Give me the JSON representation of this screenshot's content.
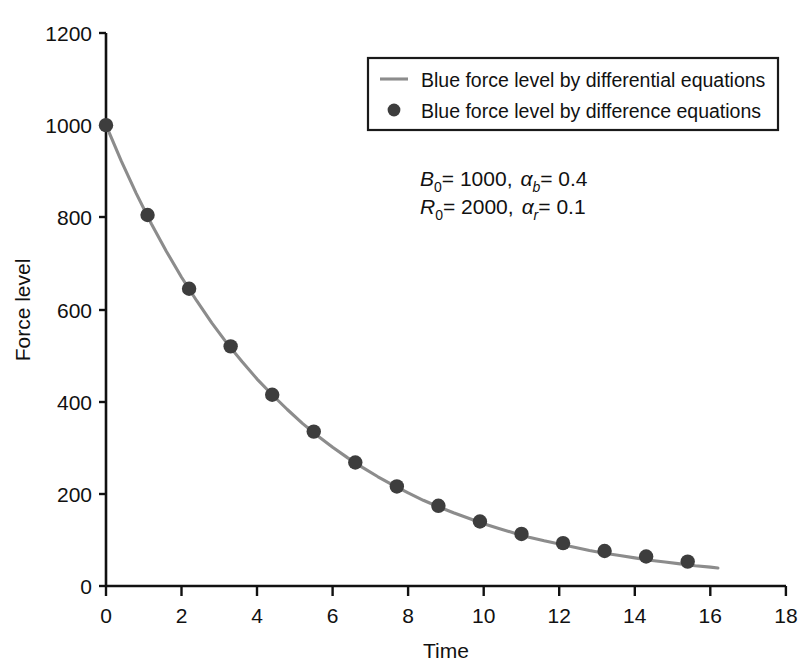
{
  "chart_data": {
    "type": "line",
    "title": "",
    "subtitle": "",
    "xlabel": "Time",
    "ylabel": "Force level",
    "xlim": [
      0,
      18
    ],
    "ylim": [
      0,
      1200
    ],
    "xticks": [
      0,
      2,
      4,
      6,
      8,
      10,
      12,
      14,
      16,
      18
    ],
    "yticks": [
      0,
      200,
      400,
      600,
      800,
      1000,
      1200
    ],
    "xtick_labels": [
      "0",
      "2",
      "4",
      "6",
      "8",
      "10",
      "12",
      "14",
      "16",
      "18"
    ],
    "ytick_labels": [
      "0",
      "200",
      "400",
      "600",
      "800",
      "1000",
      "1200"
    ],
    "grid": false,
    "legend_position": "top-right",
    "series": [
      {
        "name": "Blue force level by differential equations",
        "marker": "line",
        "color": "#8c8c8c",
        "x": [
          0.0,
          0.4,
          0.8,
          1.2,
          1.6,
          2.0,
          2.4,
          2.8,
          3.2,
          3.6,
          4.0,
          4.4,
          4.8,
          5.2,
          5.6,
          6.0,
          6.4,
          6.8,
          7.2,
          7.6,
          8.0,
          8.4,
          8.8,
          9.2,
          9.6,
          10.0,
          10.4,
          10.8,
          11.2,
          11.6,
          12.0,
          12.4,
          12.8,
          13.2,
          13.6,
          14.0,
          14.4,
          14.8,
          15.2,
          15.6,
          16.0,
          16.2
        ],
        "values": [
          1000,
          923,
          852,
          786,
          726,
          670,
          619,
          571,
          527,
          487,
          449,
          415,
          383,
          353,
          326,
          301,
          278,
          257,
          237,
          219,
          202,
          186,
          172,
          159,
          147,
          135,
          125,
          115,
          106,
          98,
          91,
          84,
          77,
          71,
          66,
          61,
          56,
          52,
          48,
          44,
          41,
          39
        ]
      },
      {
        "name": "Blue force level by difference equations",
        "marker": "circle",
        "color": "#3d3d3d",
        "x": [
          0.0,
          1.1,
          2.2,
          3.3,
          4.4,
          5.5,
          6.6,
          7.7,
          8.8,
          9.9,
          11.0,
          12.1,
          13.2,
          14.3,
          15.4
        ],
        "values": [
          1000,
          805,
          645,
          520,
          415,
          335,
          268,
          216,
          174,
          140,
          113,
          93,
          76,
          64,
          53
        ]
      }
    ],
    "annotations": [
      {
        "id": "param-line-1",
        "text": "B0 = 1000, αb = 0.4",
        "parts": [
          {
            "sym": "B",
            "sub": "0",
            "eq": "= 1000,"
          },
          {
            "sym": "α",
            "sub": "b",
            "eq": "= 0.4"
          }
        ]
      },
      {
        "id": "param-line-2",
        "text": "R0 = 2000, αr = 0.1",
        "parts": [
          {
            "sym": "R",
            "sub": "0",
            "eq": "= 2000,"
          },
          {
            "sym": "α",
            "sub": "r",
            "eq": "= 0.1"
          }
        ]
      }
    ]
  },
  "axes": {
    "x_title": "Time",
    "y_title": "Force level",
    "x_ticks": [
      "0",
      "2",
      "4",
      "6",
      "8",
      "10",
      "12",
      "14",
      "16",
      "18"
    ],
    "y_ticks": [
      "1200",
      "1000",
      "800",
      "600",
      "400",
      "200",
      "0"
    ]
  },
  "legend": {
    "entries": [
      {
        "label": "Blue force level by differential equations",
        "marker": "line",
        "color": "#8c8c8c"
      },
      {
        "label": "Blue force level by difference equations",
        "marker": "circle",
        "color": "#3d3d3d"
      }
    ]
  },
  "annotation": {
    "line1": {
      "var": "B",
      "var_sub": "0",
      "var_value": "= 1000,",
      "alpha": "α",
      "alpha_sub": "b",
      "alpha_value": "= 0.4"
    },
    "line2": {
      "var": "R",
      "var_sub": "0",
      "var_value": "= 2000,",
      "alpha": "α",
      "alpha_sub": "r",
      "alpha_value": "= 0.1"
    }
  },
  "colors": {
    "axis": "#111111",
    "line": "#8c8c8c",
    "marker": "#3d3d3d",
    "background": "#ffffff",
    "legend_border": "#1a1a1a"
  }
}
